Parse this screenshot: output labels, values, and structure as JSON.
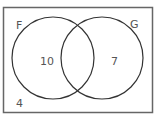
{
  "diagram": {
    "type": "venn",
    "sets": [
      {
        "name": "F",
        "label": "F",
        "only_count": "10"
      },
      {
        "name": "G",
        "label": "G",
        "only_count": "7"
      }
    ],
    "intersection_count": "",
    "outside_count": "4"
  }
}
